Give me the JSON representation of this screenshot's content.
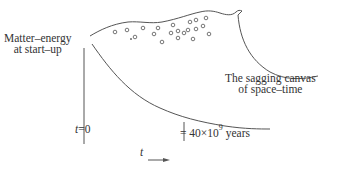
{
  "diagram": {
    "labels": {
      "start_line1": "Matter–energy",
      "start_line2": "at start–up",
      "canvas_line1": "The sagging canvas",
      "canvas_line2": "of space–time",
      "t_zero_var": "t",
      "t_zero_eq": "=0",
      "years_prefix": "= 40×10",
      "years_exp": "9",
      "years_suffix": " years",
      "time_axis_var": "t"
    },
    "colors": {
      "stroke": "#555555",
      "text": "#333333",
      "background": "#ffffff"
    },
    "galaxy_dots_count": 21
  }
}
